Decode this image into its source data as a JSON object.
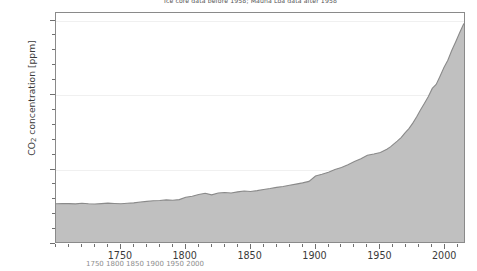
{
  "figure": {
    "title": "Ice core data before 1958; Mauna Loa data after 1958",
    "bottom_caption": "1750 1800 1850 1900 1950 2000",
    "background_color": "#ffffff",
    "plot_background_color": "#ffffff",
    "frame_color": "#8a8a8a",
    "gridline_color": "#f0f0f0"
  },
  "axes": {
    "y": {
      "label": "CO",
      "label_sub": "2",
      "label_tail": " concentration [ppm]",
      "major_ticks": [
        250,
        300,
        350,
        400
      ],
      "minor_tick_step": 10,
      "range": [
        250,
        405
      ]
    },
    "x": {
      "label": "",
      "major_ticks": [
        1750,
        1800,
        1850,
        1900,
        1950,
        2000
      ],
      "minor_tick_step": 10,
      "range": [
        1700,
        2016
      ]
    }
  },
  "chart_data": {
    "type": "area",
    "title": "Ice core data before 1958; Mauna Loa data after 1958",
    "xlabel": "",
    "ylabel": "CO2 concentration [ppm]",
    "xlim": [
      1700,
      2016
    ],
    "ylim": [
      250,
      405
    ],
    "grid": true,
    "legend": "none",
    "fill_color": "#c0c0c0",
    "line_color": "#8a8a8a",
    "series_name": "CO2 concentration",
    "x": [
      1700,
      1705,
      1710,
      1715,
      1720,
      1725,
      1730,
      1735,
      1740,
      1745,
      1750,
      1755,
      1760,
      1765,
      1770,
      1775,
      1780,
      1785,
      1790,
      1795,
      1800,
      1805,
      1810,
      1815,
      1820,
      1825,
      1830,
      1835,
      1840,
      1845,
      1850,
      1855,
      1860,
      1865,
      1870,
      1875,
      1880,
      1885,
      1890,
      1895,
      1900,
      1905,
      1910,
      1915,
      1920,
      1925,
      1930,
      1935,
      1940,
      1945,
      1950,
      1955,
      1958,
      1960,
      1963,
      1966,
      1969,
      1972,
      1975,
      1978,
      1981,
      1984,
      1987,
      1990,
      1993,
      1996,
      1999,
      2002,
      2005,
      2008,
      2011,
      2014,
      2015
    ],
    "values": [
      277.0,
      277.2,
      277.1,
      276.9,
      277.3,
      277.0,
      276.8,
      277.1,
      277.4,
      277.2,
      277.0,
      277.3,
      277.6,
      278.2,
      278.6,
      279.0,
      279.2,
      279.6,
      279.4,
      279.8,
      281.4,
      282.0,
      283.2,
      284.0,
      283.0,
      284.2,
      284.6,
      284.2,
      285.0,
      285.6,
      285.2,
      285.8,
      286.6,
      287.2,
      288.0,
      288.6,
      289.4,
      290.2,
      291.0,
      292.0,
      295.6,
      296.8,
      298.2,
      300.0,
      301.4,
      303.2,
      305.4,
      307.2,
      309.6,
      310.4,
      311.4,
      313.6,
      315.3,
      316.9,
      319.0,
      321.4,
      324.6,
      327.4,
      331.1,
      335.4,
      340.1,
      344.4,
      348.9,
      354.4,
      357.1,
      362.6,
      368.4,
      373.3,
      379.8,
      385.6,
      391.6,
      397.2,
      398.6
    ]
  }
}
